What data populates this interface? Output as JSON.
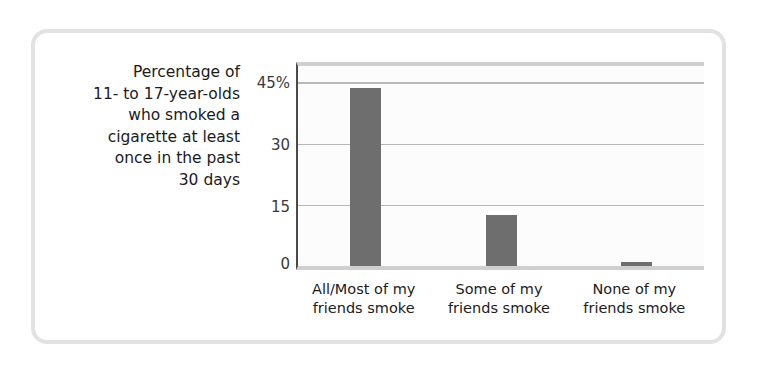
{
  "chart_data": {
    "type": "bar",
    "title": "",
    "caption_lines": [
      "Percentage of",
      "11- to 17-year-olds",
      "who smoked a",
      "cigarette at least",
      "once in the past",
      "30 days"
    ],
    "categories": [
      [
        "All/Most of my",
        "friends smoke"
      ],
      [
        "Some of my",
        "friends smoke"
      ],
      [
        "None of my",
        "friends smoke"
      ]
    ],
    "category_labels": [
      "All/Most of my friends smoke",
      "Some of my friends smoke",
      "None of my friends smoke"
    ],
    "values": [
      43.5,
      12.5,
      1
    ],
    "xlabel": "",
    "ylabel": "Percentage of 11- to 17-year-olds who smoked a cigarette at least once in the past 30 days",
    "ylim": [
      0,
      49
    ],
    "yticks": [
      0,
      15,
      30,
      45
    ],
    "ytick_labels": [
      "0",
      "15",
      "30",
      "45%"
    ],
    "grid": true,
    "gridlines_at": [
      15,
      30,
      45
    ],
    "legend": "none",
    "bar_color": "#6e6e6e",
    "grid_color": "#b7b7b7",
    "axis_color": "#4a4a4a",
    "frame_color": "#e2e2e2",
    "plot_background": "#fcfcfc"
  }
}
